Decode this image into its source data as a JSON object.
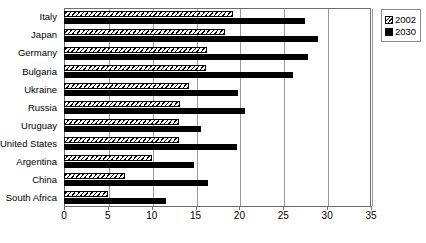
{
  "chart_data": {
    "type": "bar",
    "orientation": "horizontal",
    "title": "",
    "xlabel": "",
    "ylabel": "",
    "xlim": [
      0,
      35
    ],
    "xticks": [
      0,
      5,
      10,
      15,
      20,
      25,
      30,
      35
    ],
    "grid": true,
    "legend_position": "top-right",
    "categories": [
      "Italy",
      "Japan",
      "Germany",
      "Bulgaria",
      "Ukraine",
      "Russia",
      "Uruguay",
      "United States",
      "Argentina",
      "China",
      "South Africa"
    ],
    "series": [
      {
        "name": "2002",
        "pattern": "hatched",
        "color": "#ffffff",
        "values": [
          19.3,
          18.3,
          16.3,
          16.2,
          14.3,
          13.2,
          13.1,
          13.1,
          10.0,
          7.0,
          5.0
        ]
      },
      {
        "name": "2030",
        "pattern": "solid",
        "color": "#000000",
        "values": [
          27.5,
          29.0,
          27.8,
          26.1,
          19.8,
          20.6,
          15.6,
          19.7,
          14.8,
          16.4,
          11.6
        ]
      }
    ]
  },
  "legend": {
    "items": [
      {
        "label": "2002",
        "swatch": "hatched-swatch"
      },
      {
        "label": "2030",
        "swatch": "solid-black-swatch"
      }
    ]
  }
}
